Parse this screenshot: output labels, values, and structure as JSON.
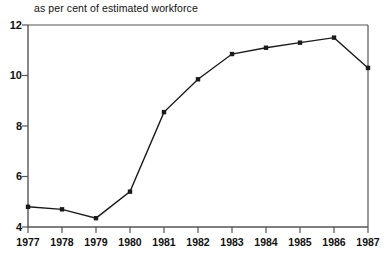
{
  "chart_data": {
    "type": "line",
    "title": "as per cent of estimated workforce",
    "subtitle": "",
    "xlabel": "",
    "ylabel": "",
    "categories": [
      "1977",
      "1978",
      "1979",
      "1980",
      "1981",
      "1982",
      "1983",
      "1984",
      "1985",
      "1986",
      "1987"
    ],
    "x": [
      1977,
      1978,
      1979,
      1980,
      1981,
      1982,
      1983,
      1984,
      1985,
      1986,
      1987
    ],
    "values": [
      4.8,
      4.7,
      4.35,
      5.4,
      8.55,
      9.85,
      10.85,
      11.1,
      11.3,
      11.5,
      10.3
    ],
    "series": [
      {
        "name": "as per cent of estimated workforce",
        "values": [
          4.8,
          4.7,
          4.35,
          5.4,
          8.55,
          9.85,
          10.85,
          11.1,
          11.3,
          11.5,
          10.3
        ]
      }
    ],
    "xlim": [
      1977,
      1987
    ],
    "ylim": [
      4,
      12
    ],
    "yticks": [
      4,
      6,
      8,
      10,
      12
    ],
    "ytick_labels": [
      "4",
      "6",
      "8",
      "10",
      "12"
    ],
    "xticks": [
      1977,
      1978,
      1979,
      1980,
      1981,
      1982,
      1983,
      1984,
      1985,
      1986,
      1987
    ],
    "grid": false,
    "legend": false,
    "legend_position": "none",
    "line_color": "#1a1a1a",
    "marker": "square",
    "marker_color": "#1a1a1a",
    "axis_color": "#555555",
    "background_color": "#ffffff"
  },
  "axis": {
    "y_labels": [
      "12",
      "10",
      "8",
      "6",
      "4"
    ],
    "x_labels": [
      "1977",
      "1978",
      "1979",
      "1980",
      "1981",
      "1982",
      "1983",
      "1984",
      "1985",
      "1986",
      "1987"
    ]
  }
}
